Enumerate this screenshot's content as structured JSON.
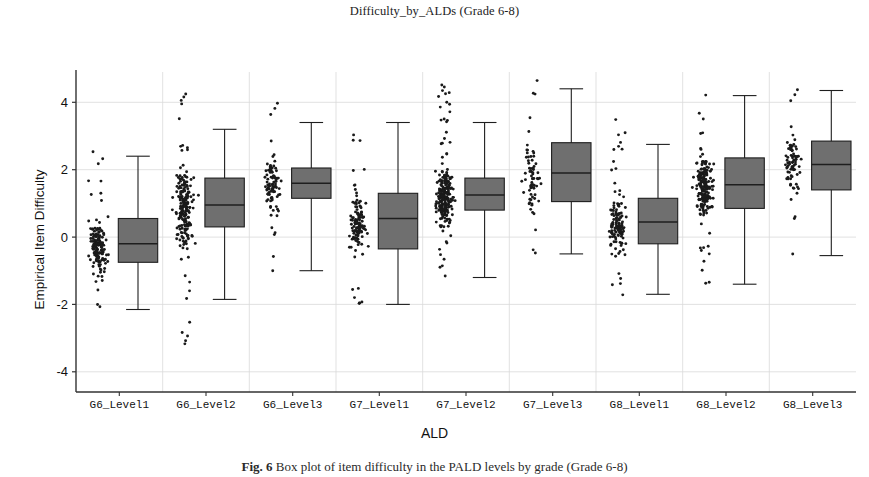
{
  "figure": {
    "title": "Difficulty_by_ALDs (Grade 6-8)",
    "caption_label": "Fig. 6",
    "caption_text": "Box plot of item difficulty in the PALD levels by grade (Grade 6-8)",
    "x_axis_title": "ALD",
    "y_axis_title": "Empirical Item Difficulty"
  },
  "chart_data": {
    "type": "box",
    "title": "Difficulty_by_ALDs (Grade 6-8)",
    "xlabel": "ALD",
    "ylabel": "Empirical Item Difficulty",
    "ylim": [
      -4.6,
      4.9
    ],
    "yticks": [
      -4,
      -2,
      0,
      2,
      4
    ],
    "ytick_labels": [
      "-4",
      "-2",
      "0",
      "2",
      "4"
    ],
    "grid": true,
    "grid_axis": "both",
    "legend": "none",
    "overlay": "jittered strip plot of individual items to the left of each box",
    "box_fill": "#6f6f6f",
    "box_edge": "#1e1e1e",
    "point_color": "#1a1a1a",
    "categories": [
      "G6_Level1",
      "G6_Level2",
      "G6_Level3",
      "G7_Level1",
      "G7_Level2",
      "G7_Level3",
      "G8_Level1",
      "G8_Level2",
      "G8_Level3"
    ],
    "boxes": [
      {
        "category": "G6_Level1",
        "whisker_low": -2.15,
        "q1": -0.75,
        "median": -0.2,
        "q3": 0.55,
        "whisker_high": 2.4,
        "n_points": 150,
        "point_spread_low": -2.3,
        "point_spread_high": 2.55,
        "point_density_center": -0.25
      },
      {
        "category": "G6_Level2",
        "whisker_low": -1.85,
        "q1": 0.3,
        "median": 0.95,
        "q3": 1.75,
        "whisker_high": 3.2,
        "n_points": 210,
        "point_spread_low": -3.6,
        "point_spread_high": 4.5,
        "point_density_center": 0.85
      },
      {
        "category": "G6_Level3",
        "whisker_low": -1.0,
        "q1": 1.15,
        "median": 1.6,
        "q3": 2.05,
        "whisker_high": 3.4,
        "n_points": 95,
        "point_spread_low": -1.15,
        "point_spread_high": 4.05,
        "point_density_center": 1.55
      },
      {
        "category": "G7_Level1",
        "whisker_low": -2.0,
        "q1": -0.35,
        "median": 0.55,
        "q3": 1.3,
        "whisker_high": 3.4,
        "n_points": 120,
        "point_spread_low": -2.05,
        "point_spread_high": 3.05,
        "point_density_center": 0.4
      },
      {
        "category": "G7_Level2",
        "whisker_low": -1.2,
        "q1": 0.8,
        "median": 1.25,
        "q3": 1.75,
        "whisker_high": 3.4,
        "n_points": 240,
        "point_spread_low": -1.35,
        "point_spread_high": 4.75,
        "point_density_center": 1.2
      },
      {
        "category": "G7_Level3",
        "whisker_low": -0.5,
        "q1": 1.05,
        "median": 1.9,
        "q3": 2.8,
        "whisker_high": 4.4,
        "n_points": 70,
        "point_spread_low": -0.6,
        "point_spread_high": 4.7,
        "point_density_center": 1.85
      },
      {
        "category": "G8_Level1",
        "whisker_low": -1.7,
        "q1": -0.2,
        "median": 0.45,
        "q3": 1.15,
        "whisker_high": 2.75,
        "n_points": 130,
        "point_spread_low": -1.85,
        "point_spread_high": 3.8,
        "point_density_center": 0.35
      },
      {
        "category": "G8_Level2",
        "whisker_low": -1.4,
        "q1": 0.85,
        "median": 1.55,
        "q3": 2.35,
        "whisker_high": 4.2,
        "n_points": 200,
        "point_spread_low": -1.55,
        "point_spread_high": 4.4,
        "point_density_center": 1.5
      },
      {
        "category": "G8_Level3",
        "whisker_low": -0.55,
        "q1": 1.4,
        "median": 2.15,
        "q3": 2.85,
        "whisker_high": 4.35,
        "n_points": 80,
        "point_spread_low": -0.65,
        "point_spread_high": 4.45,
        "point_density_center": 2.2
      }
    ]
  }
}
